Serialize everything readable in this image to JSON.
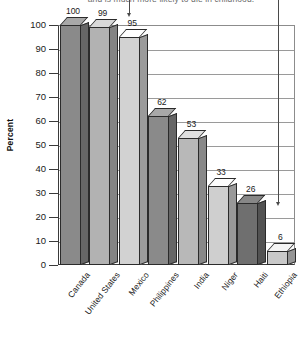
{
  "title": {
    "text": "and is much more likely to die in childhood.",
    "clipped": true
  },
  "axis": {
    "y_title": "Percent",
    "y_ticks": [
      "100",
      "90",
      "80",
      "70",
      "60",
      "50",
      "40",
      "30",
      "20",
      "10",
      "0"
    ]
  },
  "annotations": [
    {
      "name": "arrow-united-states",
      "label": ""
    },
    {
      "name": "arrow-ethiopia",
      "label": ""
    }
  ],
  "chart_data": {
    "type": "bar",
    "title": "and is much more likely to die in childhood.",
    "xlabel": "",
    "ylabel": "Percent",
    "ylim": [
      0,
      100
    ],
    "ytick_step": 10,
    "grid": true,
    "legend": "none",
    "three_d": true,
    "categories": [
      "Canada",
      "United States",
      "Mexico",
      "Philippines",
      "India",
      "Niger",
      "Haiti",
      "Ethiopia"
    ],
    "values": [
      100,
      99,
      95,
      62,
      53,
      33,
      26,
      6
    ],
    "data_labels": [
      "100",
      "99",
      "95",
      "62",
      "53",
      "33",
      "26",
      "6"
    ],
    "bar_colors": [
      "#8a8a8a",
      "#b2b2b2",
      "#d2d2d2",
      "#8a8a8a",
      "#b8b8b8",
      "#cfcfcf",
      "#6f6f6f",
      "#c9c9c9"
    ],
    "annotations": [
      {
        "type": "arrow",
        "target": "United States",
        "direction": "down"
      },
      {
        "type": "arrow",
        "target": "Ethiopia",
        "direction": "down"
      }
    ]
  }
}
